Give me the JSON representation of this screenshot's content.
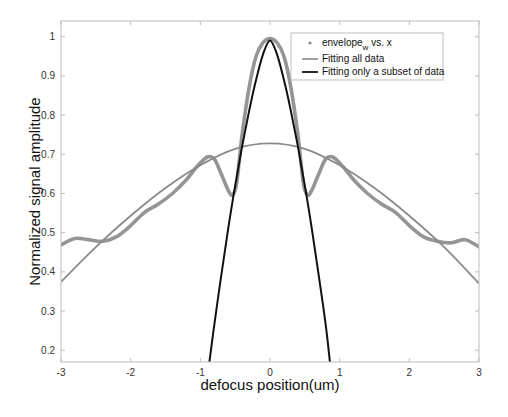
{
  "chart_data": {
    "type": "line",
    "title": "",
    "xlabel": "defocus position(um)",
    "ylabel": "Normalized signal amplitude",
    "xlim": [
      -3,
      3
    ],
    "ylim": [
      0.17,
      1.04
    ],
    "grid": false,
    "legend_position": "upper right",
    "x_ticks": [
      -3,
      -2,
      -1,
      0,
      1,
      2,
      3
    ],
    "x_tick_labels": [
      "-3",
      "-2",
      "-1",
      "0",
      "1",
      "2",
      "3"
    ],
    "y_ticks": [
      0.2,
      0.3,
      0.4,
      0.5,
      0.6,
      0.7,
      0.8,
      0.9,
      1
    ],
    "y_tick_labels": [
      "0.2",
      "0.3",
      "0.4",
      "0.5",
      "0.6",
      "0.7",
      "0.8",
      "0.9",
      "1"
    ],
    "series": [
      {
        "name": "envelope_w vs. x",
        "legend_main": "envelope",
        "legend_sub": "w",
        "legend_tail": " vs. x",
        "style": "markers",
        "color": "#8a8a8a",
        "x": [
          -3.0,
          -2.8,
          -2.6,
          -2.4,
          -2.2,
          -2.0,
          -1.8,
          -1.6,
          -1.4,
          -1.2,
          -1.05,
          -0.9,
          -0.8,
          -0.7,
          -0.6,
          -0.54,
          -0.48,
          -0.4,
          -0.3,
          -0.2,
          -0.1,
          0.0,
          0.1,
          0.2,
          0.3,
          0.4,
          0.48,
          0.54,
          0.6,
          0.7,
          0.8,
          0.9,
          1.05,
          1.2,
          1.4,
          1.6,
          1.8,
          2.0,
          2.2,
          2.4,
          2.6,
          2.8,
          3.0
        ],
        "y": [
          0.469,
          0.485,
          0.482,
          0.478,
          0.49,
          0.518,
          0.552,
          0.573,
          0.6,
          0.635,
          0.668,
          0.693,
          0.688,
          0.65,
          0.608,
          0.596,
          0.625,
          0.75,
          0.87,
          0.95,
          0.985,
          0.995,
          0.985,
          0.95,
          0.87,
          0.75,
          0.625,
          0.596,
          0.608,
          0.65,
          0.688,
          0.693,
          0.668,
          0.635,
          0.6,
          0.573,
          0.552,
          0.518,
          0.49,
          0.478,
          0.474,
          0.482,
          0.464
        ]
      },
      {
        "name": "Fitting all data",
        "style": "line",
        "color": "#8a8a8a",
        "x": [
          -3.0,
          -2.5,
          -2.0,
          -1.5,
          -1.0,
          -0.5,
          0.0,
          0.5,
          1.0,
          1.5,
          2.0,
          2.5,
          3.0
        ],
        "y": [
          0.374,
          0.463,
          0.543,
          0.614,
          0.672,
          0.714,
          0.728,
          0.714,
          0.672,
          0.614,
          0.543,
          0.463,
          0.37
        ]
      },
      {
        "name": "Fitting only a subset of data",
        "style": "line",
        "color": "#111111",
        "x": [
          -0.87,
          -0.8,
          -0.7,
          -0.6,
          -0.5,
          -0.4,
          -0.3,
          -0.2,
          -0.1,
          0.0,
          0.1,
          0.2,
          0.3,
          0.4,
          0.5,
          0.6,
          0.7,
          0.8,
          0.86
        ],
        "y": [
          0.17,
          0.265,
          0.39,
          0.51,
          0.62,
          0.72,
          0.81,
          0.89,
          0.955,
          0.99,
          0.955,
          0.89,
          0.81,
          0.72,
          0.62,
          0.51,
          0.39,
          0.265,
          0.17
        ]
      }
    ]
  }
}
